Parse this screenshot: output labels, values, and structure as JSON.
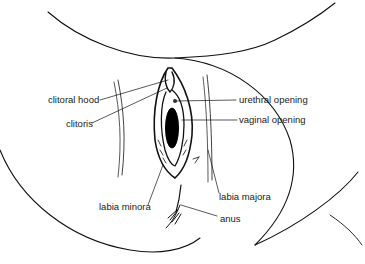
{
  "diagram": {
    "type": "anatomical line drawing",
    "labels": [
      {
        "id": "clitoral-hood",
        "text": "clitoral hood"
      },
      {
        "id": "clitoris",
        "text": "clitoris"
      },
      {
        "id": "urethral-opening",
        "text": "urethral opening"
      },
      {
        "id": "vaginal-opening",
        "text": "vaginal opening"
      },
      {
        "id": "labia-minora",
        "text": "labia minora"
      },
      {
        "id": "labia-majora",
        "text": "labia majora"
      },
      {
        "id": "anus",
        "text": "anus"
      }
    ],
    "colors": {
      "line": "#111111",
      "text": "#1a1a1a",
      "background": "#ffffff"
    }
  }
}
